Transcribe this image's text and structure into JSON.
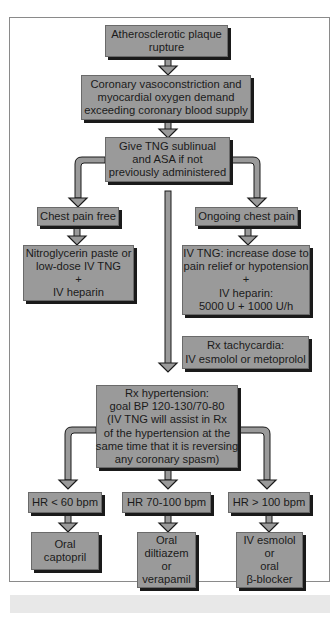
{
  "colors": {
    "box_fill": "#9a9a9a",
    "box_shadow": "#1a1a1a",
    "arrow_fill": "#9a9a9a",
    "frame_border": "#8a8a8a",
    "caption_bar": "#e8e8e8"
  },
  "flowchart": {
    "plaque": {
      "lines": [
        "Atherosclerotic plaque",
        "rupture"
      ]
    },
    "vasoconstriction": {
      "lines": [
        "Coronary vasoconstriction and",
        "myocardial oxygen demand",
        "exceeding coronary blood supply"
      ]
    },
    "give_tng": {
      "lines": [
        "Give TNG sublinual",
        "and ASA if not",
        "previously administered"
      ]
    },
    "chest_pain_free": {
      "lines": [
        "Chest pain free"
      ]
    },
    "ongoing_chest_pain": {
      "lines": [
        "Ongoing chest pain"
      ]
    },
    "nitroglycerin": {
      "lines": [
        "Nitroglycerin paste or",
        "low-dose IV TNG",
        "+",
        "IV heparin"
      ]
    },
    "iv_tng": {
      "lines": [
        "IV TNG: increase dose to",
        "pain relief or hypotension",
        "+",
        "IV heparin:",
        "5000 U + 1000 U/h"
      ]
    },
    "rx_tachycardia": {
      "lines": [
        "Rx tachycardia:",
        "IV esmolol or metoprolol"
      ]
    },
    "rx_hypertension": {
      "lines": [
        "Rx hypertension:",
        "goal BP 120-130/70-80",
        "(IV TNG will assist in Rx",
        "of the hypertension at the",
        "same time that it is reversing",
        "any coronary spasm)"
      ]
    },
    "hr_low": {
      "lines": [
        "HR < 60 bpm"
      ]
    },
    "hr_mid": {
      "lines": [
        "HR 70-100 bpm"
      ]
    },
    "hr_high": {
      "lines": [
        "HR > 100 bpm"
      ]
    },
    "oral_captopril": {
      "lines": [
        "Oral",
        "captopril"
      ]
    },
    "oral_diltiazem": {
      "lines": [
        "Oral",
        "diltiazem",
        "or",
        "verapamil"
      ]
    },
    "iv_esmolol": {
      "lines": [
        "IV esmolol",
        "or",
        "oral",
        "β-blocker"
      ]
    }
  }
}
